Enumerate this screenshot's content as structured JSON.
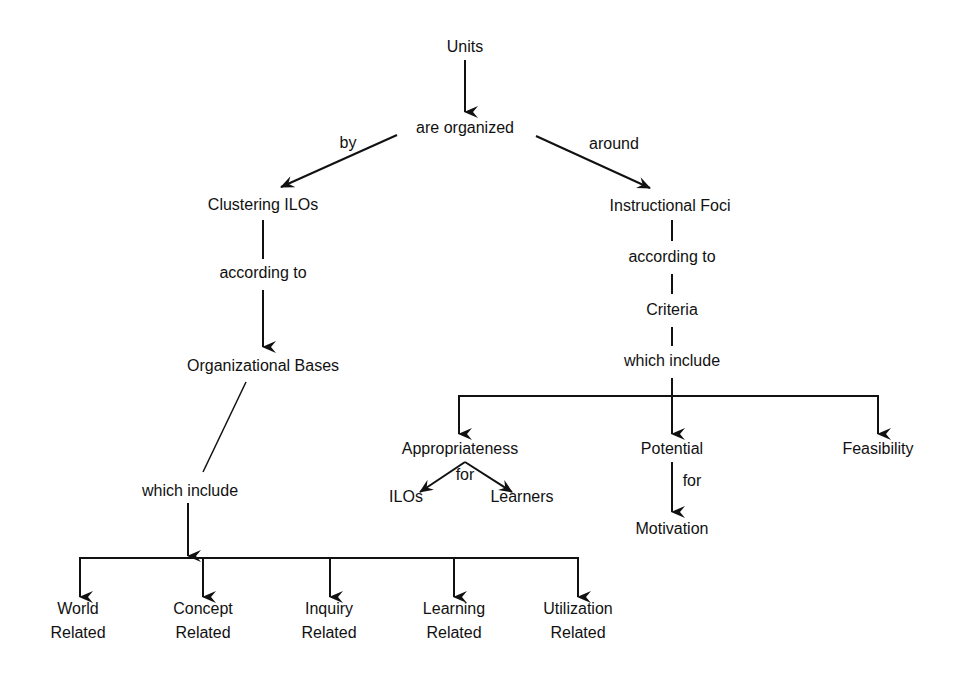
{
  "diagram": {
    "type": "concept-map",
    "root": "Units",
    "root_link": "are organized",
    "left_branch": {
      "edge_label": "by",
      "node": "Clustering ILOs",
      "link1": "according to",
      "node2": "Organizational Bases",
      "link2": "which include",
      "children": [
        {
          "line1": "World",
          "line2": "Related"
        },
        {
          "line1": "Concept",
          "line2": "Related"
        },
        {
          "line1": "Inquiry",
          "line2": "Related"
        },
        {
          "line1": "Learning",
          "line2": "Related"
        },
        {
          "line1": "Utilization",
          "line2": "Related"
        }
      ]
    },
    "right_branch": {
      "edge_label": "around",
      "node": "Instructional Foci",
      "link1": "according to",
      "node2": "Criteria",
      "link2": "which include",
      "children": [
        {
          "label": "Appropriateness",
          "edge_label": "for",
          "children": [
            "ILOs",
            "Learners"
          ]
        },
        {
          "label": "Potential",
          "edge_label": "for",
          "children": [
            "Motivation"
          ]
        },
        {
          "label": "Feasibility"
        }
      ]
    }
  },
  "colors": {
    "background": "#ffffff",
    "ink": "#111111"
  }
}
